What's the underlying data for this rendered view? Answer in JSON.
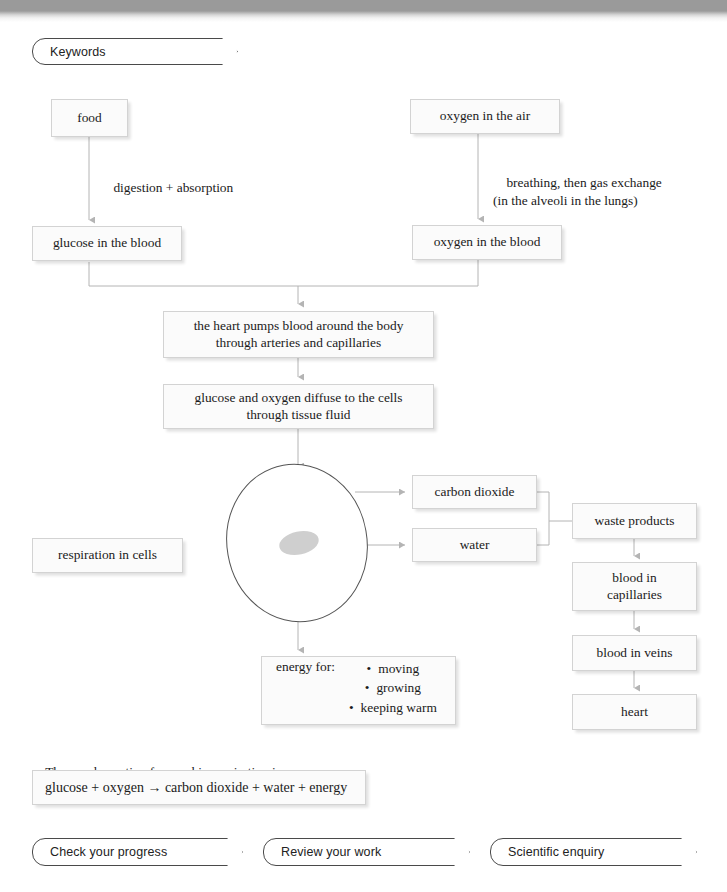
{
  "header": {
    "keywords_tab": "Keywords"
  },
  "diagram": {
    "nodes": {
      "food": "food",
      "oxygen_air": "oxygen in the air",
      "glucose_blood": "glucose in the blood",
      "oxygen_blood": "oxygen in the blood",
      "heart_pumps": "the heart pumps blood around the body\nthrough arteries and capillaries",
      "diffuse": "glucose and oxygen diffuse to the cells\nthrough tissue fluid",
      "respiration_in_cells": "respiration in cells",
      "carbon_dioxide": "carbon dioxide",
      "water": "water",
      "waste_products": "waste products",
      "blood_capillaries": "blood in\ncapillaries",
      "blood_veins": "blood in veins",
      "heart": "heart"
    },
    "edge_labels": {
      "digestion": "digestion + absorption",
      "breathing": "breathing, then gas exchange\n(in the alveoli in the lungs)"
    },
    "energy_box": {
      "label": "energy for:",
      "items": [
        "moving",
        "growing",
        "keeping warm"
      ]
    }
  },
  "equation": {
    "intro": "The word equation for aerobic respiration is:",
    "text": "glucose + oxygen → carbon dioxide + water + energy"
  },
  "footer": {
    "buttons": [
      "Check your progress",
      "Review your work",
      "Scientific enquiry"
    ]
  },
  "colors": {
    "box_fill": "#fbfbfb",
    "box_border": "#d3d3d3",
    "connector": "#b4b4b4",
    "cell_outline": "#555555",
    "nucleus_fill": "#cfcfcf",
    "pill_border": "#4a4a4a",
    "topbar": "#9a9a9a"
  }
}
